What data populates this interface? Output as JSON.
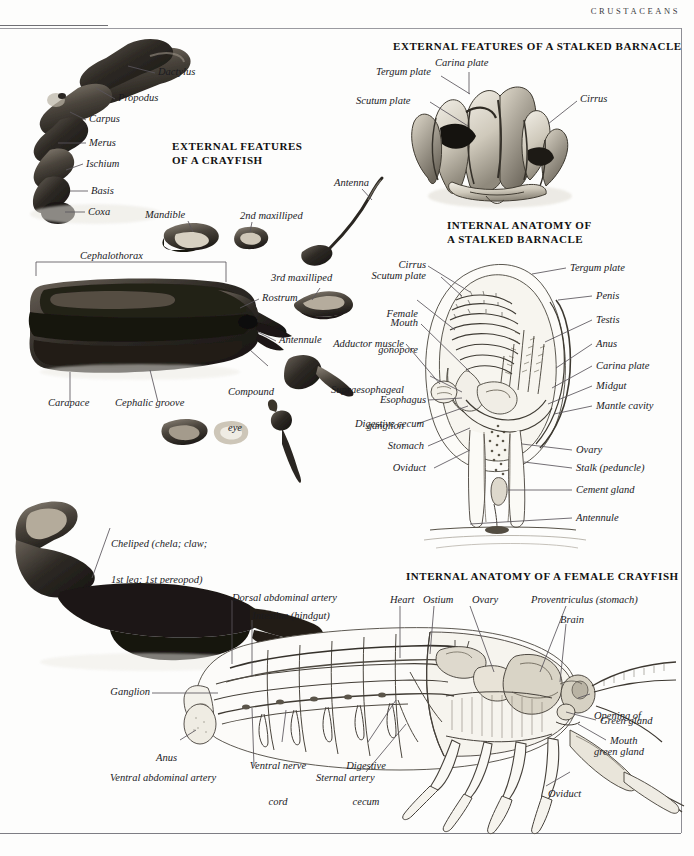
{
  "page": {
    "running_head": "CRUSTACEANS"
  },
  "sections": {
    "crayfish_external": {
      "title_line1": "EXTERNAL FEATURES",
      "title_line2": "OF A CRAYFISH"
    },
    "barnacle_external": {
      "title_line1": "EXTERNAL FEATURES OF A STALKED BARNACLE"
    },
    "barnacle_internal": {
      "title_line1": "INTERNAL ANATOMY OF",
      "title_line2": "A STALKED BARNACLE"
    },
    "crayfish_internal": {
      "title_line1": "INTERNAL ANATOMY OF A FEMALE CRAYFISH"
    }
  },
  "labels": {
    "cheliped": {
      "dactylus": "Dactylus",
      "propodus": "Propodus",
      "carpus": "Carpus",
      "merus": "Merus",
      "ischium": "Ischium",
      "basis": "Basis",
      "coxa": "Coxa"
    },
    "crayfish_parts": {
      "mandible": "Mandible",
      "maxilliped2": "2nd maxilliped",
      "maxilliped3": "3rd maxilliped",
      "antenna": "Antenna",
      "cephalothorax": "Cephalothorax",
      "rostrum": "Rostrum",
      "antennule": "Antennule",
      "compound_eye_line1": "Compound",
      "compound_eye_line2": "eye",
      "carapace": "Carapace",
      "cephalic_groove": "Cephalic groove",
      "cheliped_line1": "Cheliped (chela; claw;",
      "cheliped_line2": "1st leg; 1st pereopod)"
    },
    "barnacle_external": {
      "tergum_plate": "Tergum plate",
      "carina_plate": "Carina plate",
      "scutum_plate": "Scutum plate",
      "cirrus": "Cirrus"
    },
    "barnacle_internal": {
      "cirrus": "Cirrus",
      "scutum_plate": "Scutum plate",
      "female_gonopore_line1": "Female",
      "female_gonopore_line2": "gonopore",
      "mouth": "Mouth",
      "adductor_muscle": "Adductor muscle",
      "supraesophageal_line1": "Supraesophageal",
      "supraesophageal_line2": "ganglion",
      "esophagus": "Esophagus",
      "digestive_cecum": "Digestive cecum",
      "stomach": "Stomach",
      "oviduct": "Oviduct",
      "tergum_plate": "Tergum plate",
      "penis": "Penis",
      "testis": "Testis",
      "anus": "Anus",
      "carina_plate": "Carina plate",
      "midgut": "Midgut",
      "mantle_cavity": "Mantle cavity",
      "ovary": "Ovary",
      "stalk": "Stalk (peduncle)",
      "cement_gland": "Cement gland",
      "antennule": "Antennule"
    },
    "crayfish_internal": {
      "dorsal_abdominal_artery": "Dorsal abdominal artery",
      "intestine": "Intestine (hindgut)",
      "heart": "Heart",
      "ostium": "Ostium",
      "ovary": "Ovary",
      "proventriculus": "Proventriculus (stomach)",
      "brain": "Brain",
      "opening_green_gland_line1": "Opening of",
      "opening_green_gland_line2": "green gland",
      "green_gland": "Green gland",
      "mouth": "Mouth",
      "oviduct": "Oviduct",
      "ganglion": "Ganglion",
      "anus": "Anus",
      "ventral_abdominal_artery": "Ventral abdominal artery",
      "ventral_nerve_cord_line1": "Ventral nerve",
      "ventral_nerve_cord_line2": "cord",
      "digestive_cecum_line1": "Digestive",
      "digestive_cecum_line2": "cecum",
      "sternal_artery": "Sternal artery"
    }
  }
}
